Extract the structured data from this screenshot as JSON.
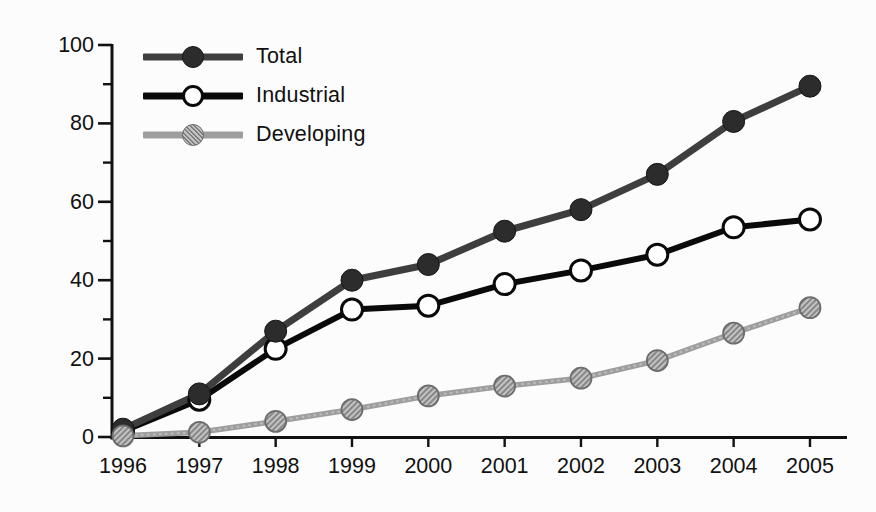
{
  "figure": {
    "background": "#fcfcfc",
    "text_color": "#101010",
    "axis_color": "#111111"
  },
  "chart_data": {
    "type": "line",
    "title": "",
    "xlabel": "",
    "ylabel": "",
    "x": [
      1996,
      1997,
      1998,
      1999,
      2000,
      2001,
      2002,
      2003,
      2004,
      2005
    ],
    "x_tick_labels": [
      "1996",
      "1997",
      "1998",
      "1999",
      "2000",
      "2001",
      "2002",
      "2003",
      "2004",
      "2005"
    ],
    "ylim": [
      0,
      100
    ],
    "y_major_ticks": [
      0,
      20,
      40,
      60,
      80,
      100
    ],
    "y_minor_ticks": [
      10,
      30,
      50,
      70,
      90
    ],
    "y_tick_labels": [
      "0",
      "20",
      "40",
      "60",
      "80",
      "100"
    ],
    "grid": false,
    "legend_position": "inside-top-left",
    "series": [
      {
        "name": "Total",
        "values": [
          2,
          11,
          27,
          40,
          44,
          52.5,
          58,
          67,
          80.5,
          89.5
        ],
        "line_color": "#3e3e3e",
        "line_width": 7,
        "marker": "filled-circle",
        "marker_fill": "#2c2c2c",
        "marker_stroke": "#161616",
        "hatched": false
      },
      {
        "name": "Industrial",
        "values": [
          1.5,
          9.5,
          22.5,
          32.5,
          33.5,
          39,
          42.5,
          46.5,
          53.5,
          55.5
        ],
        "line_color": "#0a0a0a",
        "line_width": 6,
        "marker": "open-circle",
        "marker_fill": "#ffffff",
        "marker_stroke": "#0a0a0a",
        "hatched": false
      },
      {
        "name": "Developing",
        "values": [
          0.3,
          1.2,
          4,
          7,
          10.5,
          13,
          15,
          19.5,
          26.5,
          33
        ],
        "line_color": "#9e9e9e",
        "line_width": 5.5,
        "marker": "hatched-circle",
        "marker_fill": "#c2c2c2",
        "marker_stroke": "#6c6c6c",
        "hatch_line_color": "#7d7d7d",
        "hatched": true
      }
    ]
  }
}
